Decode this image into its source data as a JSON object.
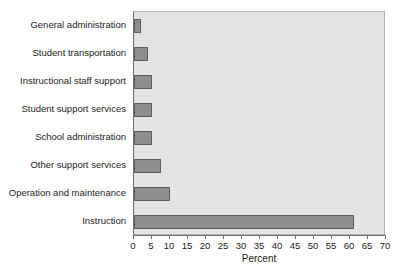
{
  "chart_data": {
    "type": "bar",
    "orientation": "horizontal",
    "title": "",
    "xlabel": "Percent",
    "ylabel": "",
    "xlim": [
      0,
      70
    ],
    "xticks": [
      0,
      5,
      10,
      15,
      20,
      25,
      30,
      35,
      40,
      45,
      50,
      55,
      60,
      65,
      70
    ],
    "grid": false,
    "legend": null,
    "categories": [
      "General administration",
      "Student transportation",
      "Instructional staff support",
      "Student support services",
      "School administration",
      "Other support services",
      "Operation and maintenance",
      "Instruction"
    ],
    "values": [
      2,
      4,
      5,
      5,
      5,
      7.5,
      10,
      61
    ],
    "colors": {
      "bar_fill": "#8e8e8e",
      "bar_border": "#5e5e5e",
      "plot_background": "#e3e3e3",
      "axis": "#6e6e6e",
      "text": "#1c1c1c",
      "page_background": "#ffffff"
    }
  }
}
